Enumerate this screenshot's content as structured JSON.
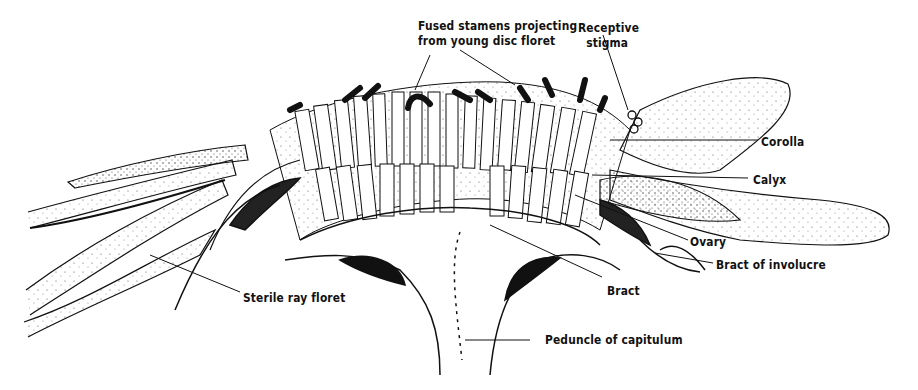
{
  "figure": {
    "colors": {
      "ink": "#111111",
      "paper": "#ffffff",
      "stipple": "#555555"
    }
  },
  "labels": {
    "fused_stamens_line1": "Fused stamens projecting",
    "fused_stamens_line2": "from young disc floret",
    "receptive_stigma_line1": "Receptive",
    "receptive_stigma_line2": "stigma",
    "corolla": "Corolla",
    "calyx": "Calyx",
    "ovary": "Ovary",
    "bract_of_involucre": "Bract of involucre",
    "bract": "Bract",
    "sterile_ray_floret": "Sterile ray floret",
    "peduncle": "Peduncle of capitulum"
  }
}
